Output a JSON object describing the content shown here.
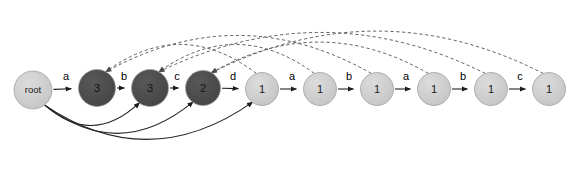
{
  "diagram": {
    "type": "directed-graph",
    "width": 572,
    "height": 172,
    "background": "#ffffff",
    "colors": {
      "node_dark_fill": "#4a4a4a",
      "node_light_fill": "#c9c9c9",
      "node_stroke": "#9a9a9a",
      "dark_node_text": "#111111",
      "light_node_text": "#1a1a1a",
      "solid_edge": "#222222",
      "dashed_edge": "#555555",
      "root_fill": "#cccccc"
    },
    "nodes": [
      {
        "id": "root",
        "label": "root",
        "x": 33,
        "y": 90,
        "r": 19,
        "shade": "light",
        "small": true
      },
      {
        "id": "n1",
        "label": "3",
        "x": 97,
        "y": 88,
        "r": 18.5,
        "shade": "dark",
        "small": false
      },
      {
        "id": "n2",
        "label": "3",
        "x": 150,
        "y": 88,
        "r": 18.5,
        "shade": "dark",
        "small": false
      },
      {
        "id": "n3",
        "label": "2",
        "x": 203,
        "y": 88,
        "r": 17.5,
        "shade": "dark",
        "small": false
      },
      {
        "id": "n4",
        "label": "1",
        "x": 262,
        "y": 89,
        "r": 16.5,
        "shade": "light",
        "small": false
      },
      {
        "id": "n5",
        "label": "1",
        "x": 320,
        "y": 89,
        "r": 16.5,
        "shade": "light",
        "small": false
      },
      {
        "id": "n6",
        "label": "1",
        "x": 377,
        "y": 89,
        "r": 16.5,
        "shade": "light",
        "small": false
      },
      {
        "id": "n7",
        "label": "1",
        "x": 434,
        "y": 89,
        "r": 16.5,
        "shade": "light",
        "small": false
      },
      {
        "id": "n8",
        "label": "1",
        "x": 491,
        "y": 89,
        "r": 16.5,
        "shade": "light",
        "small": false
      },
      {
        "id": "n9",
        "label": "1",
        "x": 549,
        "y": 89,
        "r": 16.5,
        "shade": "light",
        "small": false
      }
    ],
    "chain_edges": [
      {
        "from": "root",
        "to": "n1",
        "label": "a",
        "lx": 66,
        "ly": 76
      },
      {
        "from": "n1",
        "to": "n2",
        "label": "b",
        "lx": 124,
        "ly": 76
      },
      {
        "from": "n2",
        "to": "n3",
        "label": "c",
        "lx": 177,
        "ly": 76
      },
      {
        "from": "n3",
        "to": "n4",
        "label": "d",
        "lx": 233,
        "ly": 76
      },
      {
        "from": "n4",
        "to": "n5",
        "label": "a",
        "lx": 292,
        "ly": 76
      },
      {
        "from": "n5",
        "to": "n6",
        "label": "b",
        "lx": 349,
        "ly": 76
      },
      {
        "from": "n6",
        "to": "n7",
        "label": "a",
        "lx": 406,
        "ly": 76
      },
      {
        "from": "n7",
        "to": "n8",
        "label": "b",
        "lx": 463,
        "ly": 76
      },
      {
        "from": "n8",
        "to": "n9",
        "label": "c",
        "lx": 520,
        "ly": 76
      }
    ],
    "root_curved_edges": [
      {
        "from": "root",
        "to": "n2",
        "sag": 42
      },
      {
        "from": "root",
        "to": "n3",
        "sag": 58
      },
      {
        "from": "root",
        "to": "n4",
        "sag": 70
      }
    ],
    "suffix_links": [
      {
        "from": "n4",
        "to": "n1",
        "lift": 56
      },
      {
        "from": "n5",
        "to": "n2",
        "lift": 56
      },
      {
        "from": "n6",
        "to": "n1",
        "lift": 74
      },
      {
        "from": "n7",
        "to": "n3",
        "lift": 62
      },
      {
        "from": "n8",
        "to": "n2",
        "lift": 80
      },
      {
        "from": "n9",
        "to": "n3",
        "lift": 84
      }
    ],
    "legend": {
      "solid_meaning": "tree-edge",
      "dashed_meaning": "suffix-link"
    }
  }
}
